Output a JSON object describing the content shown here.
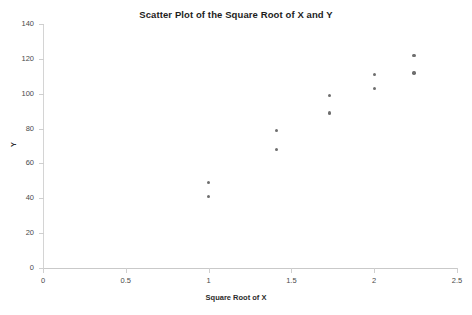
{
  "chart_data": {
    "type": "scatter",
    "title": "Scatter Plot of the Square Root of X and Y",
    "xlabel": "Square Root of X",
    "ylabel": "Y",
    "xlim": [
      0,
      2.5
    ],
    "ylim": [
      0,
      140
    ],
    "xticks": [
      "0",
      "0.5",
      "1",
      "1.5",
      "2",
      "2.5"
    ],
    "xtick_values": [
      0,
      0.5,
      1,
      1.5,
      2,
      2.5
    ],
    "yticks": [
      "0",
      "20",
      "40",
      "60",
      "80",
      "100",
      "120",
      "140"
    ],
    "ytick_values": [
      0,
      20,
      40,
      60,
      80,
      100,
      120,
      140
    ],
    "grid": false,
    "legend": false,
    "marker_color": "#6e6e6e",
    "series": [
      {
        "name": "Y vs Square Root of X",
        "points": [
          {
            "x": 1.0,
            "y": 49
          },
          {
            "x": 1.0,
            "y": 41
          },
          {
            "x": 1.41,
            "y": 79
          },
          {
            "x": 1.41,
            "y": 68
          },
          {
            "x": 1.73,
            "y": 99
          },
          {
            "x": 1.73,
            "y": 89
          },
          {
            "x": 2.0,
            "y": 111
          },
          {
            "x": 2.0,
            "y": 103
          },
          {
            "x": 2.24,
            "y": 122
          },
          {
            "x": 2.24,
            "y": 112
          }
        ]
      }
    ]
  }
}
